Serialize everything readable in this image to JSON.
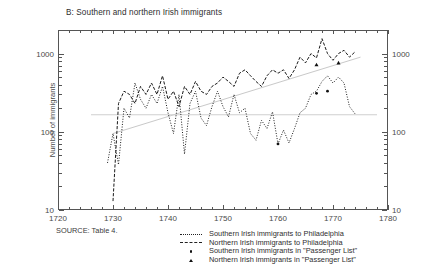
{
  "chart_data": {
    "type": "line",
    "title": "B: Southern and northern Irish immigrants",
    "xlabel": "",
    "ylabel": "Number of immigrants",
    "yscale": "log",
    "ylim": [
      10,
      2000
    ],
    "xlim": [
      1720,
      1780
    ],
    "grid": false,
    "legend_position": "below",
    "source_note": "SOURCE: Table 4.",
    "y_ticks_major": [
      10,
      100,
      1000
    ],
    "y_tick_labels": [
      "10",
      "100",
      "1000"
    ],
    "x_ticks_major": [
      1720,
      1730,
      1740,
      1750,
      1760,
      1770,
      1780
    ],
    "x_tick_labels": [
      "1720",
      "1730",
      "1740",
      "1750",
      "1760",
      "1770",
      "1780"
    ],
    "x_tick_minor_step": 2,
    "legend": [
      {
        "label": "Southern Irish immigrants to Philadelphia",
        "marker": "dotted-line"
      },
      {
        "label": "Northern Irish immigrants to Philadelphia",
        "marker": "dash-dot-line"
      },
      {
        "label": "Southern Irish immigrants in \"Passenger List\"",
        "marker": "dot-point"
      },
      {
        "label": "Northern Irish immigrants in \"Passenger List\"",
        "marker": "triangle-point"
      }
    ],
    "series": [
      {
        "name": "Southern Irish immigrants to Philadelphia",
        "style": "dotted",
        "color": "#1a1a1a",
        "x": [
          1729,
          1730,
          1731,
          1732,
          1733,
          1734,
          1735,
          1736,
          1737,
          1738,
          1739,
          1740,
          1741,
          1742,
          1743,
          1744,
          1745,
          1746,
          1747,
          1748,
          1749,
          1750,
          1751,
          1752,
          1753,
          1754,
          1755,
          1756,
          1757,
          1758,
          1759,
          1760,
          1761,
          1762,
          1763,
          1764,
          1765,
          1766,
          1767,
          1768,
          1769,
          1770,
          1771,
          1772,
          1773,
          1774
        ],
        "values": [
          40,
          95,
          38,
          200,
          150,
          420,
          260,
          200,
          300,
          230,
          380,
          175,
          95,
          300,
          52,
          230,
          330,
          150,
          120,
          210,
          330,
          210,
          155,
          300,
          175,
          200,
          95,
          78,
          140,
          110,
          180,
          70,
          105,
          72,
          110,
          175,
          200,
          300,
          330,
          440,
          520,
          420,
          500,
          420,
          210,
          170
        ]
      },
      {
        "name": "Northern Irish immigrants to Philadelphia",
        "style": "dash-dot",
        "color": "#1a1a1a",
        "x": [
          1730,
          1731,
          1732,
          1733,
          1734,
          1735,
          1736,
          1737,
          1738,
          1739,
          1740,
          1741,
          1742,
          1743,
          1744,
          1745,
          1746,
          1747,
          1748,
          1749,
          1750,
          1751,
          1752,
          1753,
          1754,
          1755,
          1756,
          1757,
          1758,
          1759,
          1760,
          1761,
          1762,
          1763,
          1764,
          1765,
          1766,
          1767,
          1768,
          1769,
          1770,
          1771,
          1772,
          1773,
          1774
        ],
        "values": [
          13,
          230,
          330,
          300,
          230,
          380,
          300,
          420,
          300,
          520,
          260,
          330,
          210,
          380,
          300,
          440,
          330,
          300,
          380,
          420,
          500,
          440,
          380,
          560,
          620,
          520,
          440,
          380,
          520,
          620,
          560,
          620,
          480,
          620,
          900,
          760,
          1000,
          880,
          1550,
          1000,
          820,
          1000,
          1100,
          900,
          1050
        ]
      }
    ],
    "trend_lines": [
      {
        "name": "rising-trend",
        "x": [
          1730,
          1775
        ],
        "values": [
          95,
          900
        ],
        "color": "#c9c9c9"
      },
      {
        "name": "flat-trend",
        "x": [
          1726,
          1778
        ],
        "values": [
          165,
          165
        ],
        "color": "#cfcfcf"
      }
    ],
    "point_markers": [
      {
        "name": "southern-passenger-list",
        "shape": "dot",
        "x": [
          1760,
          1767,
          1769
        ],
        "values": [
          70,
          310,
          330
        ]
      },
      {
        "name": "northern-passenger-list",
        "shape": "triangle",
        "x": [
          1767,
          1771
        ],
        "values": [
          720,
          760
        ]
      }
    ]
  }
}
